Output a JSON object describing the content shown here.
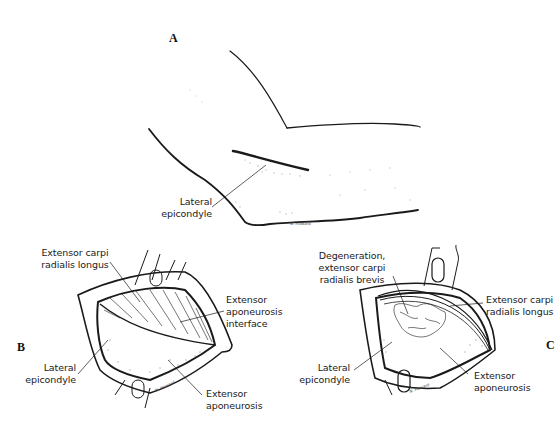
{
  "figure": {
    "panels": [
      {
        "id": "A",
        "letter": "A",
        "description": "Lateral view of flexed elbow",
        "labels": [
          {
            "text": "Lateral\nepicondyle"
          }
        ],
        "signature": "N. Howard"
      },
      {
        "id": "B",
        "letter": "B",
        "description": "Surgical exposure of extensor aponeurosis",
        "labels": [
          {
            "text": "Extensor carpi\nradialis longus"
          },
          {
            "text": "Extensor\naponeurosis\ninterface"
          },
          {
            "text": "Lateral\nepicondyle"
          },
          {
            "text": "Extensor\naponeurosis"
          }
        ],
        "signature": "N. Howard"
      },
      {
        "id": "C",
        "letter": "C",
        "description": "Exposure showing degenerated ECRB",
        "labels": [
          {
            "text": "Degeneration,\nextensor carpi\nradialis brevis"
          },
          {
            "text": "Extensor carpi\nradialis longus"
          },
          {
            "text": "Lateral\nepicondyle"
          },
          {
            "text": "Extensor\naponeurosis"
          }
        ],
        "signature": "N. Howard"
      }
    ],
    "colors": {
      "ink": "#1a1a1a",
      "background": "#ffffff"
    }
  }
}
